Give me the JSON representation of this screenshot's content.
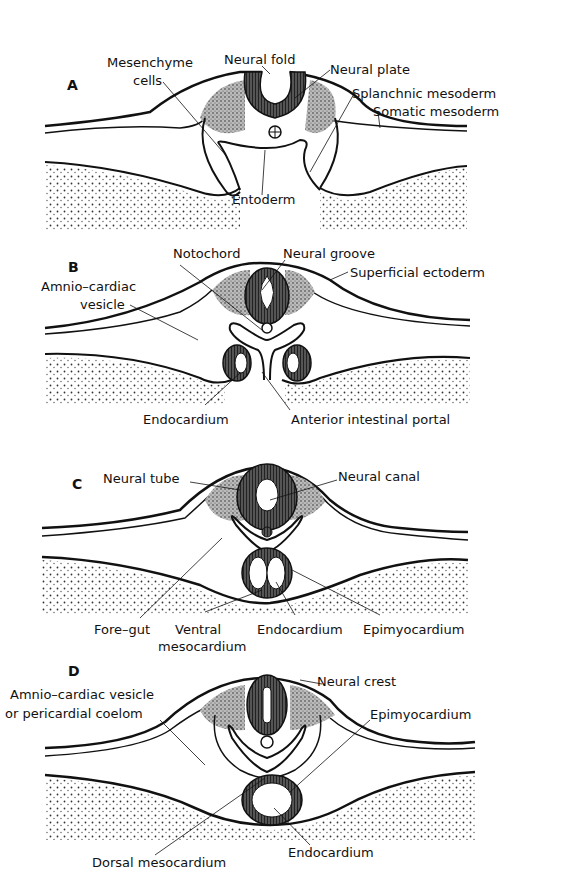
{
  "figure": {
    "colors": {
      "ink": "#111111",
      "background": "#ffffff",
      "stipple": "#444444"
    }
  },
  "panels": [
    {
      "letter": "A",
      "labels": {
        "mesenchyme": "Mesenchyme",
        "cells": "cells",
        "neural_fold": "Neural fold",
        "neural_plate": "Neural plate",
        "splanchnic": "Splanchnic  mesoderm",
        "somatic": "Somatic mesoderm",
        "entoderm": "Entoderm"
      }
    },
    {
      "letter": "B",
      "labels": {
        "notochord": "Notochord",
        "neural_groove": "Neural groove",
        "amnio1": "Amnio–cardiac",
        "amnio2": "vesicle",
        "superficial": "Superficial ectoderm",
        "endocardium": "Endocardium",
        "portal": "Anterior intestinal portal"
      }
    },
    {
      "letter": "C",
      "labels": {
        "neural_tube": "Neural tube",
        "neural_canal": "Neural canal",
        "foregut": "Fore–gut",
        "ventral1": "Ventral",
        "ventral2": "mesocardium",
        "endocardium": "Endocardium",
        "epimyocardium": "Epimyocardium"
      }
    },
    {
      "letter": "D",
      "labels": {
        "neural_crest": "Neural crest",
        "amnio1": "Amnio–cardiac vesicle",
        "amnio2": "or pericardial coelom",
        "epimyocardium": "Epimyocardium",
        "dorsal": "Dorsal mesocardium",
        "endocardium": "Endocardium"
      }
    }
  ]
}
